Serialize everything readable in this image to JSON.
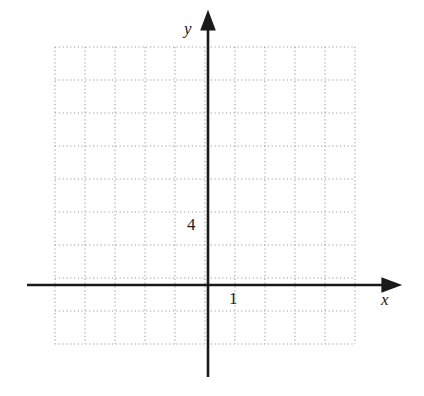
{
  "figure": {
    "name": "coordinate-grid",
    "background_color": "#ffffff",
    "axis_color": "#1a1a1a",
    "grid_color": "#aaaaaa"
  },
  "axes": {
    "x_axis_label": "x",
    "y_axis_label": "y"
  },
  "ticks": {
    "x": [
      {
        "label": "1",
        "value": 1
      }
    ],
    "y": [
      {
        "label": "4",
        "value": 4
      }
    ]
  },
  "chart_data": {
    "type": "scatter",
    "title": "",
    "subtitle": "",
    "xlabel": "x",
    "ylabel": "y",
    "series": [
      {
        "name": "",
        "x": [],
        "y": []
      }
    ],
    "x": [],
    "values": [],
    "categories": [],
    "annotations": [],
    "legend": [],
    "legend_position": "none",
    "grid": true,
    "grid_style": "dotted",
    "xlim": [
      -5,
      5
    ],
    "ylim": [
      -2,
      16
    ],
    "xtick_labels": [
      "1"
    ],
    "ytick_labels": [
      "4"
    ],
    "xticks": [
      1
    ],
    "yticks": [
      4
    ],
    "x_minor_step": 1,
    "y_minor_step": 2
  },
  "geometry": {
    "grid_left": 55,
    "grid_top": 47,
    "grid_right": 355,
    "grid_bottom": 344,
    "cell_width": 30,
    "cell_height": 33,
    "origin_x": 208,
    "origin_y": 285,
    "x_axis_start": 27,
    "x_axis_end": 394,
    "y_axis_top": 20,
    "y_axis_bottom": 377
  }
}
